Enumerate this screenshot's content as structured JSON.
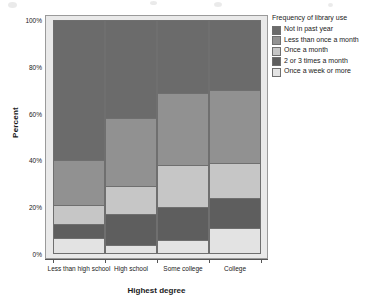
{
  "chart_data": {
    "type": "bar",
    "subtype": "stacked-100-percent",
    "title": "",
    "xlabel": "Highest degree",
    "ylabel": "Percent",
    "categories": [
      "Less than high school",
      "High school",
      "Some college",
      "College"
    ],
    "ylim": [
      0,
      100
    ],
    "ytick_labels": [
      "0%",
      "20%",
      "40%",
      "60%",
      "80%",
      "100%"
    ],
    "ytick_values": [
      0,
      20,
      40,
      60,
      80,
      100
    ],
    "grid": false,
    "legend_position": "right",
    "legend_title": "Frequency of library use",
    "series": [
      {
        "name": "Not in past year",
        "color": "#6b6b6b",
        "values": [
          60,
          42,
          31,
          30
        ]
      },
      {
        "name": "Less than once a month",
        "color": "#919191",
        "values": [
          19,
          29,
          31,
          31
        ]
      },
      {
        "name": "Once a month",
        "color": "#c6c6c6",
        "values": [
          8,
          12,
          18,
          15
        ]
      },
      {
        "name": "2 or 3 times a month",
        "color": "#5e5e5e",
        "values": [
          6,
          13,
          14,
          13
        ]
      },
      {
        "name": "Once a week or more",
        "color": "#e3e3e3",
        "values": [
          7,
          4,
          6,
          11
        ]
      }
    ]
  },
  "legend": {
    "title": "Frequency of library use",
    "items": [
      {
        "label": "Not in past year",
        "color": "#6b6b6b"
      },
      {
        "label": "Less than once a month",
        "color": "#919191"
      },
      {
        "label": "Once a month",
        "color": "#c6c6c6"
      },
      {
        "label": "2 or 3 times a month",
        "color": "#5e5e5e"
      },
      {
        "label": "Once a week or more",
        "color": "#e3e3e3"
      }
    ]
  },
  "axes": {
    "y_title": "Percent",
    "x_title": "Highest degree"
  }
}
